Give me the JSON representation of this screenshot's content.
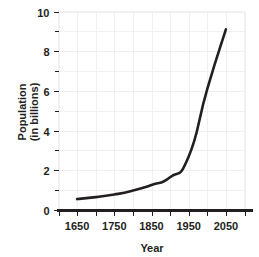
{
  "chart_data": {
    "type": "line",
    "title": "",
    "xlabel": "Year",
    "ylabel": "Population (in billions)",
    "ylabel_line1": "Population",
    "ylabel_line2": "(in billions)",
    "xlim": [
      1600,
      2100
    ],
    "ylim": [
      0,
      10
    ],
    "grid": true,
    "legend": "none",
    "x_major_labels": [
      "1650",
      "1750",
      "1850",
      "1950",
      "2050"
    ],
    "x_major_values": [
      1650,
      1750,
      1850,
      1950,
      2050
    ],
    "x_tick_values": [
      1600,
      1650,
      1700,
      1750,
      1800,
      1850,
      1900,
      1950,
      2000,
      2050,
      2100
    ],
    "y_major_labels": [
      "0",
      "2",
      "4",
      "6",
      "8",
      "10"
    ],
    "y_major_values": [
      0,
      2,
      4,
      6,
      8,
      10
    ],
    "y_minor_values": [
      1,
      3,
      5,
      7,
      9
    ],
    "series": [
      {
        "name": "World population",
        "x": [
          1650,
          1700,
          1750,
          1800,
          1850,
          1900,
          1950,
          2000,
          2050
        ],
        "values": [
          0.55,
          0.65,
          0.78,
          0.98,
          1.26,
          1.65,
          2.7,
          6.1,
          9.1
        ]
      }
    ],
    "line_color": "#231f20",
    "grid_color": "#f0f0f0",
    "axis_color": "#231f20",
    "background_color": "#ffffff"
  }
}
